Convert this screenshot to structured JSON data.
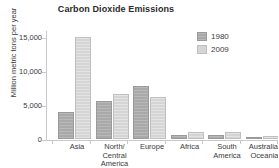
{
  "chart_data": {
    "type": "bar",
    "title": "Carbon Dioxide Emissions",
    "xlabel": "",
    "ylabel": "Million metric tons per year",
    "ylim": [
      0,
      16000
    ],
    "yticks": [
      0,
      5000,
      10000,
      15000
    ],
    "ytick_labels": [
      "0",
      "5,000",
      "10,000",
      "15,000"
    ],
    "grid": false,
    "legend_position": "upper right",
    "categories": [
      "Asia",
      "North/\nCentral\nAmerica",
      "Europe",
      "Africa",
      "South\nAmerica",
      "Australia/\nOceania"
    ],
    "category_labels": [
      [
        "Asia"
      ],
      [
        "North/",
        "Central",
        "America"
      ],
      [
        "Europe"
      ],
      [
        "Africa"
      ],
      [
        "South",
        "America"
      ],
      [
        "Australia/",
        "Oceania"
      ]
    ],
    "series": [
      {
        "name": "1980",
        "color": "#a9a9a9",
        "values": [
          3900,
          5600,
          7800,
          650,
          550,
          250
        ]
      },
      {
        "name": "2009",
        "color": "#d5d5d5",
        "values": [
          15000,
          6600,
          6200,
          1100,
          1000,
          450
        ]
      }
    ]
  },
  "legend": {
    "entries": [
      {
        "label": "1980"
      },
      {
        "label": "2009"
      }
    ]
  },
  "colors": {
    "series_1980": "#a9a9a9",
    "series_2009": "#d5d5d5",
    "axis": "#c9c9c9",
    "text": "#3a3a3a",
    "background": "#ffffff"
  }
}
